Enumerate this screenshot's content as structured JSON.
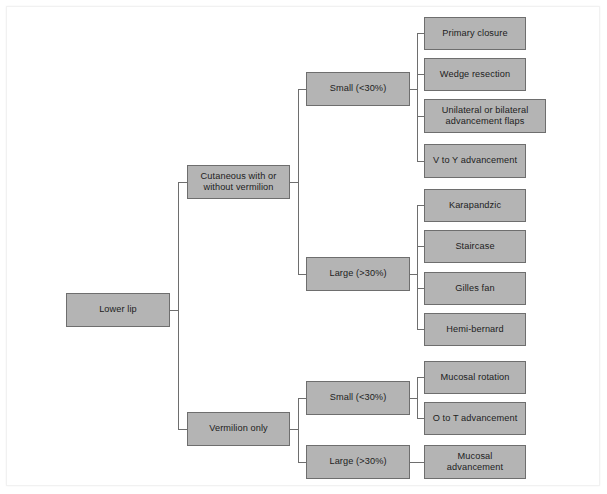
{
  "diagram": {
    "type": "flowchart",
    "style": {
      "node_fill": "#b4b4b4",
      "node_border": "#6e6e6e",
      "connector": "#6e6e6e",
      "background": "#ffffff",
      "text": "#1d1d1d"
    },
    "nodes": {
      "root": {
        "label": "Lower lip",
        "x": 66,
        "y": 293,
        "w": 104,
        "h": 34
      },
      "branch_cutaneous": {
        "label": "Cutaneous with or\nwithout vermilion",
        "x": 187,
        "y": 165,
        "w": 103,
        "h": 34
      },
      "branch_vermilion": {
        "label": "Vermilion only",
        "x": 187,
        "y": 412,
        "w": 103,
        "h": 34
      },
      "cut_small": {
        "label": "Small (<30%)",
        "x": 306,
        "y": 72,
        "w": 104,
        "h": 34
      },
      "cut_large": {
        "label": "Large (>30%)",
        "x": 306,
        "y": 257,
        "w": 104,
        "h": 34
      },
      "verm_small": {
        "label": "Small (<30%)",
        "x": 306,
        "y": 381,
        "w": 104,
        "h": 34
      },
      "verm_large": {
        "label": "Large (>30%)",
        "x": 306,
        "y": 445,
        "w": 104,
        "h": 34
      },
      "leaf_primary_closure": {
        "label": "Primary closure",
        "x": 424,
        "y": 17,
        "w": 102,
        "h": 33
      },
      "leaf_wedge_resection": {
        "label": "Wedge resection",
        "x": 424,
        "y": 58,
        "w": 102,
        "h": 33
      },
      "leaf_unilateral_bilateral": {
        "label": "Unilateral or bilateral\nadvancement flaps",
        "x": 424,
        "y": 99,
        "w": 122,
        "h": 34
      },
      "leaf_v_to_y": {
        "label": "V to Y advancement",
        "x": 424,
        "y": 144,
        "w": 102,
        "h": 34
      },
      "leaf_karapandzic": {
        "label": "Karapandzic",
        "x": 424,
        "y": 189,
        "w": 102,
        "h": 33
      },
      "leaf_staircase": {
        "label": "Staircase",
        "x": 424,
        "y": 230,
        "w": 102,
        "h": 33
      },
      "leaf_gilles_fan": {
        "label": "Gilles fan",
        "x": 424,
        "y": 272,
        "w": 102,
        "h": 33
      },
      "leaf_hemi_bernard": {
        "label": "Hemi-bernard",
        "x": 424,
        "y": 313,
        "w": 102,
        "h": 33
      },
      "leaf_mucosal_rotation": {
        "label": "Mucosal rotation",
        "x": 424,
        "y": 361,
        "w": 102,
        "h": 33
      },
      "leaf_o_to_t": {
        "label": "O to T advancement",
        "x": 424,
        "y": 402,
        "w": 102,
        "h": 33
      },
      "leaf_mucosal_advancement": {
        "label": "Mucosal\nadvancement",
        "x": 424,
        "y": 445,
        "w": 102,
        "h": 34
      }
    },
    "edges": [
      {
        "from": "root",
        "to": "branch_cutaneous"
      },
      {
        "from": "root",
        "to": "branch_vermilion"
      },
      {
        "from": "branch_cutaneous",
        "to": "cut_small"
      },
      {
        "from": "branch_cutaneous",
        "to": "cut_large"
      },
      {
        "from": "branch_vermilion",
        "to": "verm_small"
      },
      {
        "from": "branch_vermilion",
        "to": "verm_large"
      },
      {
        "from": "cut_small",
        "to": "leaf_primary_closure"
      },
      {
        "from": "cut_small",
        "to": "leaf_wedge_resection"
      },
      {
        "from": "cut_small",
        "to": "leaf_unilateral_bilateral"
      },
      {
        "from": "cut_small",
        "to": "leaf_v_to_y"
      },
      {
        "from": "cut_large",
        "to": "leaf_karapandzic"
      },
      {
        "from": "cut_large",
        "to": "leaf_staircase"
      },
      {
        "from": "cut_large",
        "to": "leaf_gilles_fan"
      },
      {
        "from": "cut_large",
        "to": "leaf_hemi_bernard"
      },
      {
        "from": "verm_small",
        "to": "leaf_mucosal_rotation"
      },
      {
        "from": "verm_small",
        "to": "leaf_o_to_t"
      },
      {
        "from": "verm_large",
        "to": "leaf_mucosal_advancement"
      }
    ]
  }
}
